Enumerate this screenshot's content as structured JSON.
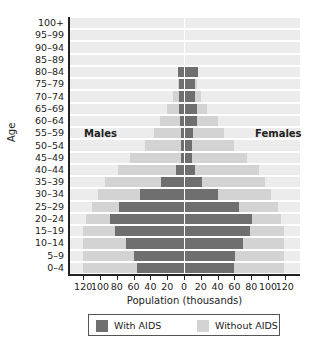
{
  "chart_data": {
    "type": "bar",
    "subtype": "population-pyramid",
    "title": "",
    "xlabel": "Population (thousands)",
    "ylabel": "Age",
    "xlim": [
      -120,
      120
    ],
    "x_ticks": [
      120,
      100,
      80,
      60,
      40,
      20,
      0,
      20,
      40,
      60,
      80,
      100,
      120
    ],
    "categories": [
      "0–4",
      "5–9",
      "10–14",
      "15–19",
      "20–24",
      "25–29",
      "30–34",
      "35–39",
      "40–44",
      "45–49",
      "50–54",
      "55–59",
      "60–64",
      "65–69",
      "70–74",
      "75–79",
      "80–84",
      "85–89",
      "90–94",
      "95–99",
      "100+"
    ],
    "side_labels": {
      "left": "Males",
      "right": "Females"
    },
    "legend": [
      {
        "name": "With AIDS",
        "color": "#6f6f6f"
      },
      {
        "name": "Without AIDS",
        "color": "#d3d3d3"
      }
    ],
    "series": [
      {
        "name": "Males With AIDS",
        "side": "left",
        "values": [
          56,
          60,
          69,
          82,
          88,
          77,
          52,
          27,
          10,
          4,
          3,
          3,
          5,
          6,
          6,
          6,
          7,
          0,
          0,
          0,
          0
        ]
      },
      {
        "name": "Males Without AIDS",
        "side": "left",
        "values": [
          120,
          120,
          120,
          120,
          117,
          110,
          102,
          94,
          79,
          64,
          46,
          36,
          29,
          20,
          13,
          7,
          7,
          0,
          0,
          0,
          0
        ]
      },
      {
        "name": "Females With AIDS",
        "side": "right",
        "values": [
          59,
          61,
          70,
          79,
          81,
          65,
          41,
          22,
          13,
          9,
          9,
          11,
          15,
          15,
          13,
          13,
          17,
          0,
          0,
          0,
          0
        ]
      },
      {
        "name": "Females Without AIDS",
        "side": "right",
        "values": [
          119,
          119,
          119,
          119,
          116,
          112,
          104,
          96,
          89,
          75,
          59,
          48,
          40,
          27,
          20,
          16,
          17,
          0,
          0,
          0,
          0
        ]
      }
    ],
    "legend_position": "bottom",
    "grid": false
  },
  "colors": {
    "with_aids": "#6f6f6f",
    "without_aids": "#d3d3d3",
    "row_background": "#ececec"
  }
}
